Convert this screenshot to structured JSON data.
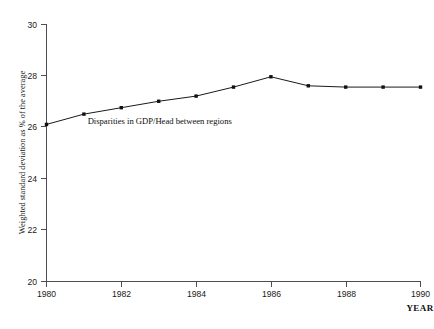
{
  "page": {
    "background_color": "#ffffff",
    "ink_color": "#111111",
    "axis_color": "#4d4d55",
    "cropped_header_text": "· · · · · · · · · · · · ·"
  },
  "chart_data": {
    "type": "line",
    "title": "",
    "xlabel": "YEAR",
    "ylabel": "Weighted standard deviation as % of the average",
    "x": [
      1980,
      1981,
      1982,
      1983,
      1984,
      1985,
      1986,
      1987,
      1988,
      1989,
      1990
    ],
    "categories": [
      "1980",
      "1981",
      "1982",
      "1983",
      "1984",
      "1985",
      "1986",
      "1987",
      "1988",
      "1989",
      "1990"
    ],
    "values": [
      26.1,
      26.5,
      26.75,
      27.0,
      27.2,
      27.55,
      27.95,
      27.6,
      27.55,
      27.55,
      27.55
    ],
    "series": [
      {
        "name": "Disparities in GDP/Head between regions",
        "values": [
          26.1,
          26.5,
          26.75,
          27.0,
          27.2,
          27.55,
          27.95,
          27.6,
          27.55,
          27.55,
          27.55
        ],
        "color": "#111111",
        "marker": "square"
      }
    ],
    "annotations": [
      {
        "text": "Disparities in GDP/Head between regions",
        "x": 1981.1,
        "y": 26.25
      }
    ],
    "xlim": [
      1980,
      1990
    ],
    "ylim": [
      20,
      30
    ],
    "xticks": [
      1980,
      1982,
      1984,
      1986,
      1988,
      1990
    ],
    "xtick_labels": [
      "1980",
      "1982",
      "1984",
      "1986",
      "1988",
      "1990"
    ],
    "yticks": [
      20,
      22,
      24,
      26,
      28,
      30
    ],
    "ytick_labels": [
      "20",
      "22",
      "24",
      "26",
      "28",
      "30"
    ],
    "xtick_minor": [
      1981,
      1983,
      1985,
      1987,
      1989
    ],
    "grid": false,
    "legend": false,
    "legend_position": "none"
  }
}
